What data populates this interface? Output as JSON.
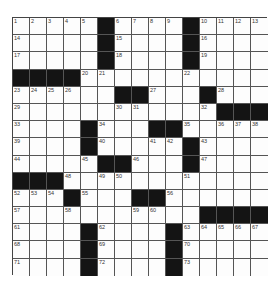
{
  "puzzle": {
    "size": [
      15,
      15
    ],
    "black_color": "#141414",
    "rows": [
      [
        "1",
        "2",
        "3",
        "4",
        "5",
        "#",
        "6",
        "7",
        "8",
        "9",
        "#",
        "10",
        "11",
        "12",
        "13"
      ],
      [
        "14",
        "",
        "",
        "",
        "",
        "#",
        "15",
        "",
        "",
        "",
        "#",
        "16",
        "",
        "",
        ""
      ],
      [
        "17",
        "",
        "",
        "",
        "",
        "#",
        "18",
        "",
        "",
        "",
        "#",
        "19",
        "",
        "",
        ""
      ],
      [
        "#",
        "#",
        "#",
        "#",
        "20",
        "21",
        "",
        "",
        "",
        "",
        "22",
        "",
        "",
        "",
        ""
      ],
      [
        "23",
        "24",
        "25",
        "26",
        "",
        "",
        "#",
        "#",
        "27",
        "",
        "",
        "#",
        "28",
        "",
        ""
      ],
      [
        "29",
        "",
        "",
        "",
        "",
        "",
        "30",
        "31",
        "",
        "",
        "",
        "32",
        "#",
        "#",
        "#"
      ],
      [
        "33",
        "",
        "",
        "",
        "#",
        "34",
        "",
        "",
        "#",
        "#",
        "35",
        "",
        "36",
        "37",
        "38"
      ],
      [
        "39",
        "",
        "",
        "",
        "#",
        "40",
        "",
        "",
        "41",
        "42",
        "#",
        "43",
        "",
        "",
        ""
      ],
      [
        "44",
        "",
        "",
        "",
        "45",
        "#",
        "#",
        "46",
        "",
        "",
        "#",
        "47",
        "",
        "",
        ""
      ],
      [
        "#",
        "#",
        "#",
        "48",
        "",
        "49",
        "50",
        "",
        "",
        "",
        "51",
        "",
        "",
        "",
        ""
      ],
      [
        "52",
        "53",
        "54",
        "#",
        "55",
        "",
        "",
        "#",
        "#",
        "56",
        "",
        "",
        "",
        "",
        ""
      ],
      [
        "57",
        "",
        "",
        "58",
        "",
        "",
        "",
        "59",
        "60",
        "",
        "",
        "#",
        "#",
        "#",
        "#"
      ],
      [
        "61",
        "",
        "",
        "",
        "#",
        "62",
        "",
        "",
        "",
        "#",
        "63",
        "64",
        "65",
        "66",
        "67"
      ],
      [
        "68",
        "",
        "",
        "",
        "#",
        "69",
        "",
        "",
        "",
        "#",
        "70",
        "",
        "",
        "",
        ""
      ],
      [
        "71",
        "",
        "",
        "",
        "#",
        "72",
        "",
        "",
        "",
        "#",
        "73",
        "",
        "",
        "",
        ""
      ]
    ]
  }
}
